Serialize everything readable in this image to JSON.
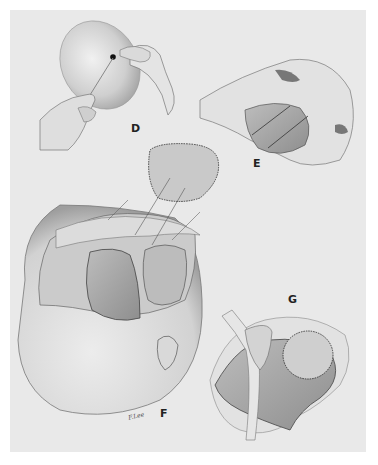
{
  "figure": {
    "background_color": "#e9e9e9",
    "page_color": "#ffffff",
    "ink_color": "#333333",
    "panels": [
      {
        "id": "D",
        "label": "D",
        "description": "Hands passing a needle and thread through a rounded skin flap"
      },
      {
        "id": "E",
        "label": "E",
        "description": "Hands holding open a tissue pocket with guide arrows"
      },
      {
        "id": "F",
        "label": "F",
        "description": "Head with scalp flap reflected, graft lifted above with arrows"
      },
      {
        "id": "G",
        "label": "G",
        "description": "Close-up of retracted wound with dashed circular outline"
      }
    ],
    "signature": "F.Lee"
  }
}
